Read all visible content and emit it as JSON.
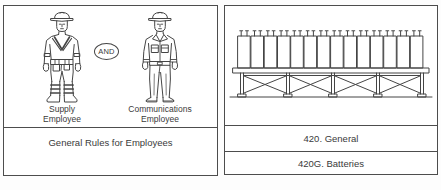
{
  "colors": {
    "line": "#454545",
    "text": "#3a3a3a",
    "panel_border": "#4d4d4d",
    "background": "#ffffff"
  },
  "left_panel": {
    "connector_label": "AND",
    "figures": [
      {
        "illustration": "supply-employee-illustration",
        "caption_line1": "Supply",
        "caption_line2": "Employee"
      },
      {
        "illustration": "communications-employee-illustration",
        "caption_line1": "Communications",
        "caption_line2": "Employee"
      }
    ],
    "footer_caption": "General Rules for Employees"
  },
  "right_panel": {
    "illustration": "battery-rack-illustration",
    "battery_cells": 14,
    "rows": [
      {
        "label": "420. General"
      },
      {
        "label": "420G. Batteries"
      }
    ]
  }
}
